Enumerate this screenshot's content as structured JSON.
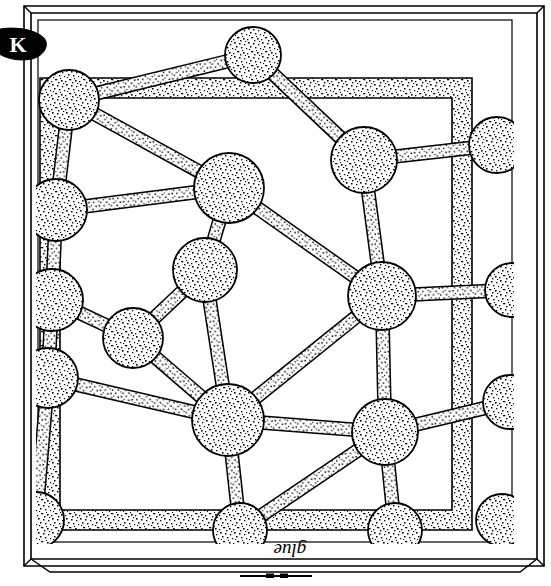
{
  "figure": {
    "kind": "line-drawing-diagram",
    "background_color": "#ffffff",
    "ink_color": "#000000",
    "stipple_color": "#1a1a1a",
    "labels": {
      "glue_label": "glue",
      "glue_label_rotation_deg": 180,
      "corner_blob_label": "K",
      "tick_mark": "—"
    },
    "frame": {
      "outer_rule_1": {
        "x": 24,
        "y": 6,
        "w": 520,
        "h": 560
      },
      "outer_rule_2": {
        "x": 30,
        "y": 12,
        "w": 514,
        "h": 554
      },
      "inner_rule": {
        "x": 36,
        "y": 18,
        "w": 478,
        "h": 526
      },
      "band_color": "#ffffff",
      "band_stroke": "#000000"
    },
    "border_band": {
      "x": 40,
      "y": 78,
      "w": 432,
      "h": 452,
      "thickness": 20,
      "description": "stippled square band forming the outer cell wall"
    },
    "blob": {
      "name": "ink-blob-K",
      "cx": 22,
      "cy": 44,
      "rx": 24,
      "ry": 15,
      "fill": "#000000",
      "glyph": "K",
      "glyph_color": "#ffffff"
    }
  },
  "chart_data": {
    "type": "diagram",
    "title": "",
    "nodes": [
      {
        "id": "n1",
        "cx": 69,
        "cy": 100,
        "r": 30
      },
      {
        "id": "n2",
        "cx": 253,
        "cy": 55,
        "r": 28
      },
      {
        "id": "n3",
        "cx": 364,
        "cy": 160,
        "r": 33
      },
      {
        "id": "n4",
        "cx": 497,
        "cy": 145,
        "r": 28
      },
      {
        "id": "n5",
        "cx": 56,
        "cy": 210,
        "r": 31
      },
      {
        "id": "n6",
        "cx": 229,
        "cy": 188,
        "r": 35
      },
      {
        "id": "n7",
        "cx": 205,
        "cy": 270,
        "r": 32
      },
      {
        "id": "n8",
        "cx": 382,
        "cy": 296,
        "r": 34
      },
      {
        "id": "n9",
        "cx": 512,
        "cy": 290,
        "r": 27
      },
      {
        "id": "n10",
        "cx": 52,
        "cy": 300,
        "r": 31
      },
      {
        "id": "n11",
        "cx": 133,
        "cy": 338,
        "r": 30
      },
      {
        "id": "n12",
        "cx": 48,
        "cy": 378,
        "r": 30
      },
      {
        "id": "n13",
        "cx": 228,
        "cy": 420,
        "r": 36
      },
      {
        "id": "n14",
        "cx": 385,
        "cy": 432,
        "r": 33
      },
      {
        "id": "n15",
        "cx": 510,
        "cy": 402,
        "r": 27
      },
      {
        "id": "n16",
        "cx": 36,
        "cy": 520,
        "r": 28
      },
      {
        "id": "n17",
        "cx": 240,
        "cy": 530,
        "r": 27
      },
      {
        "id": "n18",
        "cx": 395,
        "cy": 530,
        "r": 27
      },
      {
        "id": "n19",
        "cx": 502,
        "cy": 520,
        "r": 26
      }
    ],
    "edges": [
      {
        "from": "n1",
        "to": "n2",
        "w": 13
      },
      {
        "from": "n1",
        "to": "n5",
        "w": 13
      },
      {
        "from": "n1",
        "to": "n6",
        "w": 13
      },
      {
        "from": "n2",
        "to": "n3",
        "w": 13
      },
      {
        "from": "n3",
        "to": "n4",
        "w": 13
      },
      {
        "from": "n3",
        "to": "n8",
        "w": 13
      },
      {
        "from": "n5",
        "to": "n6",
        "w": 13
      },
      {
        "from": "n5",
        "to": "n10",
        "w": 13
      },
      {
        "from": "n6",
        "to": "n7",
        "w": 13
      },
      {
        "from": "n6",
        "to": "n8",
        "w": 13
      },
      {
        "from": "n7",
        "to": "n11",
        "w": 13
      },
      {
        "from": "n7",
        "to": "n13",
        "w": 13
      },
      {
        "from": "n8",
        "to": "n9",
        "w": 13
      },
      {
        "from": "n8",
        "to": "n13",
        "w": 13
      },
      {
        "from": "n8",
        "to": "n14",
        "w": 13
      },
      {
        "from": "n10",
        "to": "n11",
        "w": 13
      },
      {
        "from": "n10",
        "to": "n12",
        "w": 13
      },
      {
        "from": "n11",
        "to": "n13",
        "w": 13
      },
      {
        "from": "n12",
        "to": "n13",
        "w": 13
      },
      {
        "from": "n12",
        "to": "n16",
        "w": 13
      },
      {
        "from": "n13",
        "to": "n14",
        "w": 13
      },
      {
        "from": "n13",
        "to": "n17",
        "w": 13
      },
      {
        "from": "n14",
        "to": "n15",
        "w": 13
      },
      {
        "from": "n14",
        "to": "n17",
        "w": 13
      },
      {
        "from": "n14",
        "to": "n18",
        "w": 13
      }
    ],
    "border_anchored_nodes": [
      "n1",
      "n2",
      "n3",
      "n4",
      "n5",
      "n9",
      "n10",
      "n12",
      "n15",
      "n16",
      "n17",
      "n18",
      "n19"
    ],
    "counts": {
      "nodes": 19,
      "edges": 25
    },
    "legend": [],
    "annotations": [
      {
        "text": "glue",
        "x": 276,
        "y": 552,
        "rotation": 180
      },
      {
        "text": "K",
        "x": 18,
        "y": 48,
        "rotation": 0
      }
    ]
  }
}
